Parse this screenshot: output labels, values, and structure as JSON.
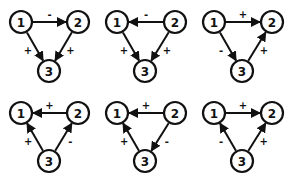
{
  "diagram": {
    "title": "",
    "node_radius": 11,
    "colors": {
      "stroke": "#111111",
      "fill": "#ffffff",
      "background": "#ffffff"
    },
    "triads": [
      {
        "id": "triad-1",
        "nodes": [
          {
            "label": "1",
            "x": 21,
            "y": 22
          },
          {
            "label": "2",
            "x": 78,
            "y": 22
          },
          {
            "label": "3",
            "x": 49,
            "y": 71
          }
        ],
        "edges": [
          {
            "from": "1",
            "to": "2",
            "sign": "-"
          },
          {
            "from": "1",
            "to": "3",
            "sign": "+"
          },
          {
            "from": "2",
            "to": "3",
            "sign": "+"
          }
        ]
      },
      {
        "id": "triad-2",
        "nodes": [
          {
            "label": "1",
            "x": 117,
            "y": 22
          },
          {
            "label": "2",
            "x": 175,
            "y": 22
          },
          {
            "label": "3",
            "x": 145,
            "y": 71
          }
        ],
        "edges": [
          {
            "from": "2",
            "to": "1",
            "sign": "-"
          },
          {
            "from": "1",
            "to": "3",
            "sign": "+"
          },
          {
            "from": "2",
            "to": "3",
            "sign": "+"
          }
        ]
      },
      {
        "id": "triad-3",
        "nodes": [
          {
            "label": "1",
            "x": 214,
            "y": 22
          },
          {
            "label": "2",
            "x": 272,
            "y": 22
          },
          {
            "label": "3",
            "x": 242,
            "y": 71
          }
        ],
        "edges": [
          {
            "from": "1",
            "to": "2",
            "sign": "+"
          },
          {
            "from": "1",
            "to": "3",
            "sign": "-"
          },
          {
            "from": "3",
            "to": "2",
            "sign": "+"
          }
        ]
      },
      {
        "id": "triad-4",
        "nodes": [
          {
            "label": "1",
            "x": 21,
            "y": 113
          },
          {
            "label": "2",
            "x": 78,
            "y": 113
          },
          {
            "label": "3",
            "x": 49,
            "y": 161
          }
        ],
        "edges": [
          {
            "from": "2",
            "to": "1",
            "sign": "+"
          },
          {
            "from": "3",
            "to": "1",
            "sign": "+"
          },
          {
            "from": "3",
            "to": "2",
            "sign": "-"
          }
        ]
      },
      {
        "id": "triad-5",
        "nodes": [
          {
            "label": "1",
            "x": 117,
            "y": 113
          },
          {
            "label": "2",
            "x": 175,
            "y": 113
          },
          {
            "label": "3",
            "x": 145,
            "y": 161
          }
        ],
        "edges": [
          {
            "from": "2",
            "to": "1",
            "sign": "+"
          },
          {
            "from": "3",
            "to": "1",
            "sign": "+"
          },
          {
            "from": "2",
            "to": "3",
            "sign": "-"
          }
        ]
      },
      {
        "id": "triad-6",
        "nodes": [
          {
            "label": "1",
            "x": 214,
            "y": 113
          },
          {
            "label": "2",
            "x": 272,
            "y": 113
          },
          {
            "label": "3",
            "x": 242,
            "y": 161
          }
        ],
        "edges": [
          {
            "from": "1",
            "to": "2",
            "sign": "+"
          },
          {
            "from": "3",
            "to": "1",
            "sign": "-"
          },
          {
            "from": "3",
            "to": "2",
            "sign": "+"
          }
        ]
      }
    ]
  }
}
